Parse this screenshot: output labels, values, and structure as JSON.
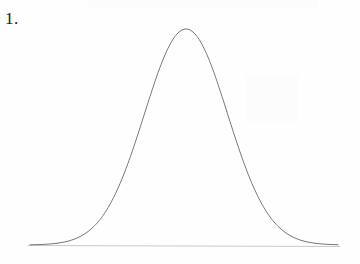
{
  "page": {
    "background_color": "#fefefe",
    "width": 360,
    "height": 264
  },
  "item": {
    "number_label": "1."
  },
  "chart_data": {
    "type": "line",
    "title": "",
    "subtitle": "",
    "xlabel": "",
    "ylabel": "",
    "curve_name": "normal-distribution",
    "curve_color": "#777777",
    "curve_stroke_width": 1,
    "axis_color": "#c9c9c9",
    "axis_stroke_width": 1,
    "grid": false,
    "legend": null,
    "legend_position": "none",
    "annotations": [],
    "tick_labels": {
      "x": [],
      "y": []
    },
    "axis": {
      "baseline_y_px": 245,
      "x_start_px": 28,
      "x_end_px": 340
    },
    "gaussian": {
      "peak_x_px": 186,
      "peak_y_px": 29,
      "sigma_px": 41.6,
      "amplitude_px": 216,
      "curve_x_start_px": 30,
      "curve_x_end_px": 338
    },
    "xlim": [
      28,
      340
    ],
    "ylim": [
      0,
      1
    ],
    "x": [
      30,
      40,
      50,
      60,
      70,
      80,
      90,
      100,
      110,
      120,
      130,
      140,
      150,
      160,
      170,
      180,
      186,
      190,
      200,
      210,
      220,
      230,
      240,
      250,
      260,
      270,
      280,
      290,
      300,
      310,
      320,
      330,
      338
    ],
    "values": [
      0.0018,
      0.0037,
      0.0073,
      0.0139,
      0.0253,
      0.0443,
      0.0743,
      0.1197,
      0.1851,
      0.2749,
      0.3921,
      0.5372,
      0.7072,
      0.8947,
      0.9856,
      0.9932,
      1.0,
      0.9954,
      0.9044,
      0.7203,
      0.5512,
      0.4051,
      0.286,
      0.1939,
      0.1262,
      0.0789,
      0.0474,
      0.0273,
      0.0151,
      0.008,
      0.0041,
      0.002,
      0.0012
    ]
  }
}
